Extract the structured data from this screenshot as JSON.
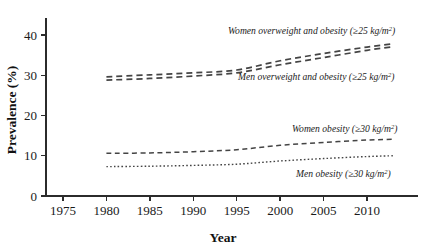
{
  "chart_data": {
    "type": "line",
    "title": "",
    "xlabel": "Year",
    "ylabel": "Prevalence (%)",
    "xlim": [
      1972,
      2014
    ],
    "ylim": [
      0,
      44
    ],
    "grid": false,
    "legend_position": "inline-annotations",
    "x_ticks": [
      "1975",
      "1980",
      "1985",
      "1990",
      "1995",
      "2000",
      "2005",
      "2010"
    ],
    "x_tick_values": [
      1975,
      1980,
      1985,
      1990,
      1995,
      2000,
      2005,
      2010
    ],
    "y_ticks": [
      "0",
      "10",
      "20",
      "30",
      "40"
    ],
    "y_tick_values": [
      0,
      10,
      20,
      30,
      40
    ],
    "x": [
      1980,
      1985,
      1990,
      1995,
      2000,
      2005,
      2010,
      2013
    ],
    "series": [
      {
        "name": "Women overweight and obesity (≥25 kg/m²)",
        "label_main": "Women overweight and obesity (≥25 kg/m",
        "label_sup": "2",
        "label_tail": ")",
        "dash": "6,4",
        "stroke_width": 1.7,
        "color": "#444444",
        "values": [
          29.6,
          30.1,
          30.6,
          31.3,
          33.6,
          35.4,
          37.0,
          37.8
        ]
      },
      {
        "name": "Men overweight and obesity (≥25 kg/m²)",
        "label_main": "Men overweight and obesity (≥25 kg/m",
        "label_sup": "2",
        "label_tail": ")",
        "dash": "6,4",
        "stroke_width": 1.7,
        "color": "#444444",
        "values": [
          28.8,
          29.2,
          29.8,
          30.6,
          32.6,
          34.4,
          36.2,
          37.1
        ]
      },
      {
        "name": "Women obesity (≥30 kg/m²)",
        "label_main": "Women obesity (≥30 kg/m",
        "label_sup": "2",
        "label_tail": ")",
        "dash": "5,3.5",
        "stroke_width": 1.5,
        "color": "#444444",
        "values": [
          10.6,
          10.7,
          11.0,
          11.5,
          12.6,
          13.3,
          13.9,
          14.1
        ]
      },
      {
        "name": "Men obesity (≥30 kg/m²)",
        "label_main": "Men obesity (≥30 kg/m",
        "label_sup": "2",
        "label_tail": ")",
        "dash": "1.6,2.2",
        "stroke_width": 1.4,
        "color": "#444444",
        "values": [
          7.3,
          7.4,
          7.6,
          7.9,
          8.7,
          9.3,
          9.8,
          10.0
        ]
      }
    ],
    "annotations": [
      {
        "text": "Women overweight and obesity (≥25 kg/m²)",
        "x_px": 228,
        "y_px": 34
      },
      {
        "text": "Men overweight and obesity (≥25 kg/m²)",
        "x_px": 238,
        "y_px": 80
      },
      {
        "text": "Women obesity (≥30 kg/m²)",
        "x_px": 292,
        "y_px": 132
      },
      {
        "text": "Men obesity (≥30 kg/m²)",
        "x_px": 296,
        "y_px": 177
      }
    ]
  }
}
